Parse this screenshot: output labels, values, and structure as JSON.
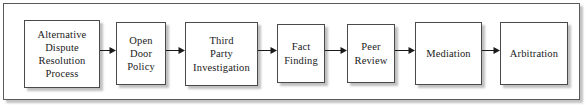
{
  "diagram": {
    "type": "linear-process-flow",
    "orientation": "left-to-right",
    "frame": {
      "border_color": "#5a5a5a",
      "background": "#ffffff"
    },
    "node_style": {
      "border_color": "#4a4a4a",
      "fill": "#ffffff",
      "text_color": "#1a1a1a",
      "shadow": true
    },
    "connector_style": {
      "color": "#1a1a1a",
      "arrowhead": "filled-triangle"
    },
    "nodes": [
      {
        "id": "adr-process",
        "label": "Alternative\nDispute\nResolution\nProcess",
        "x": 24,
        "y": 20,
        "w": 76,
        "h": 68
      },
      {
        "id": "open-door-policy",
        "label": "Open\nDoor\nPolicy",
        "x": 116,
        "y": 22,
        "w": 50,
        "h": 63
      },
      {
        "id": "third-party-invest",
        "label": "Third\nParty\nInvestigation",
        "x": 185,
        "y": 22,
        "w": 73,
        "h": 64
      },
      {
        "id": "fact-finding",
        "label": "Fact\nFinding",
        "x": 277,
        "y": 24,
        "w": 48,
        "h": 59
      },
      {
        "id": "peer-review",
        "label": "Peer\nReview",
        "x": 347,
        "y": 24,
        "w": 48,
        "h": 59
      },
      {
        "id": "mediation",
        "label": "Mediation",
        "x": 415,
        "y": 22,
        "w": 67,
        "h": 63
      },
      {
        "id": "arbitration",
        "label": "Arbitration",
        "x": 500,
        "y": 22,
        "w": 68,
        "h": 63
      }
    ],
    "connectors": [
      {
        "id": "c1",
        "from": "adr-process",
        "to": "open-door-policy",
        "x": 100,
        "y": 50,
        "w": 16
      },
      {
        "id": "c2",
        "from": "open-door-policy",
        "to": "third-party-invest",
        "x": 166,
        "y": 50,
        "w": 19
      },
      {
        "id": "c3",
        "from": "third-party-invest",
        "to": "fact-finding",
        "x": 258,
        "y": 50,
        "w": 19
      },
      {
        "id": "c4",
        "from": "fact-finding",
        "to": "peer-review",
        "x": 325,
        "y": 50,
        "w": 22
      },
      {
        "id": "c5",
        "from": "peer-review",
        "to": "mediation",
        "x": 395,
        "y": 50,
        "w": 20
      },
      {
        "id": "c6",
        "from": "mediation",
        "to": "arbitration",
        "x": 482,
        "y": 50,
        "w": 18
      }
    ]
  }
}
